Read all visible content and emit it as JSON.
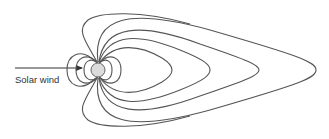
{
  "diagram": {
    "type": "magnetosphere field lines",
    "labels": {
      "solar_wind": "Solar wind"
    },
    "planet": {
      "name": "Earth",
      "fill": "#dcdcdc",
      "stroke": "#666666"
    },
    "colors": {
      "line": "#555555",
      "background": "#ffffff"
    }
  }
}
